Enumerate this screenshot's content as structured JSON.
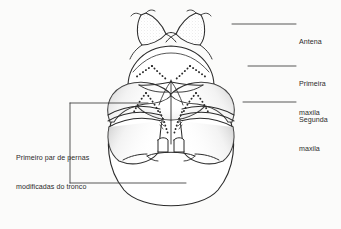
{
  "figure": {
    "background_color": "#fbfbfa",
    "ink_color": "#2b2b2b",
    "stipple_color": "#6f6f6f",
    "labels": [
      {
        "id": "antena",
        "text": "Antena",
        "lines": [
          "Antena"
        ],
        "leader": {
          "x1": 232,
          "y1": 24,
          "x2": 296,
          "y2": 24
        }
      },
      {
        "id": "primeira-maxila",
        "text": "Primeira maxila",
        "lines": [
          "Primeira",
          "maxila"
        ],
        "leader": {
          "x1": 248,
          "y1": 66,
          "x2": 296,
          "y2": 66
        }
      },
      {
        "id": "segunda-maxila",
        "text": "Segunda maxila",
        "lines": [
          "Segunda",
          "maxila"
        ],
        "leader": {
          "x1": 243,
          "y1": 102,
          "x2": 296,
          "y2": 102
        }
      },
      {
        "id": "primeiro-par-pernas",
        "text": "Primeiro par de pernas modificadas do tronco",
        "lines": [
          "Primeiro par de pernas",
          "modificadas do tronco"
        ],
        "bracket": {
          "x": 70,
          "y_top": 103,
          "y_bottom": 183,
          "x_top_end": 148,
          "x_bottom_end": 186
        }
      }
    ],
    "structures": [
      "antena-esquerda",
      "antena-direita",
      "cabeca",
      "primeira-maxila-esquerda",
      "primeira-maxila-direita",
      "segunda-maxila-esquerda",
      "segunda-maxila-direita",
      "perna-modificada-esquerda",
      "perna-modificada-direita",
      "tronco",
      "boca-central"
    ]
  }
}
